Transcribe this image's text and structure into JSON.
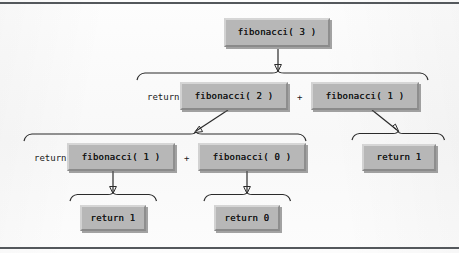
{
  "figure": {
    "type": "recursion-tree",
    "nodes": [
      {
        "id": "n0",
        "label": "fibonacci( 3 )",
        "level": 0
      },
      {
        "id": "n1",
        "label": "fibonacci( 2 )",
        "level": 1
      },
      {
        "id": "n2",
        "label": "fibonacci( 1 )",
        "level": 1
      },
      {
        "id": "n3",
        "label": "fibonacci( 1 )",
        "level": 2
      },
      {
        "id": "n4",
        "label": "fibonacci( 0 )",
        "level": 2
      },
      {
        "id": "n5",
        "label": "return 1",
        "level": 2
      },
      {
        "id": "n6",
        "label": "return 1",
        "level": 3
      },
      {
        "id": "n7",
        "label": "return 0",
        "level": 3
      }
    ],
    "keywords": {
      "return_1": "return",
      "return_2": "return",
      "plus_1": "+",
      "plus_2": "+"
    },
    "colors": {
      "node_fill": "#b7b7b7",
      "node_highlight": "#d6d6d6",
      "node_shadow": "#8a8a8a",
      "line": "#2b2b2b",
      "rule": "#54585c",
      "page": "#fbfbfb"
    }
  }
}
